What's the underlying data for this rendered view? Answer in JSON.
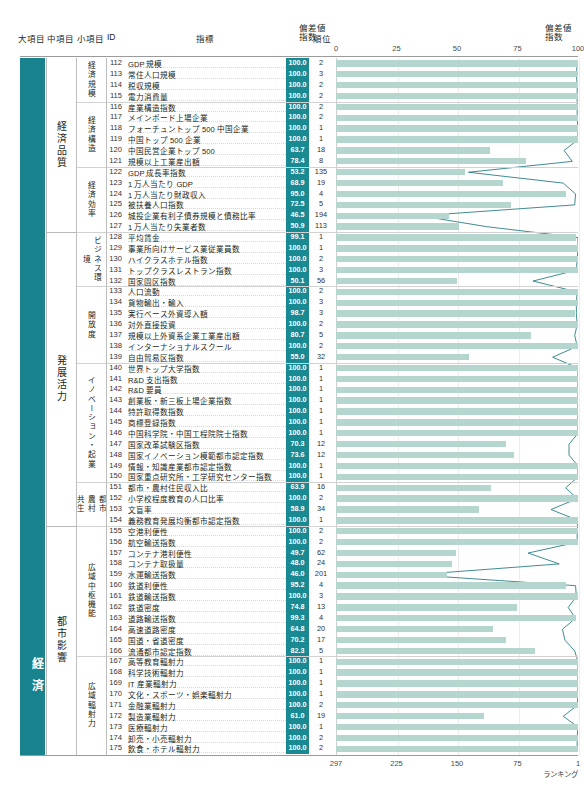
{
  "header": {
    "col_big": "大項目",
    "col_mid": "中項目",
    "col_small": "小項目",
    "col_id": "ID",
    "col_indicator": "指標",
    "col_dev": "偏差値\n指数",
    "col_dev_line1": "偏差値",
    "col_dev_line2": "指数",
    "col_rank": "順位",
    "col_dev_right_line1": "偏差値",
    "col_dev_right_line2": "指数"
  },
  "axis_top": {
    "ticks": [
      "0",
      "25",
      "50",
      "75",
      "100"
    ]
  },
  "axis_bottom": {
    "ticks": [
      "297",
      "225",
      "150",
      "75",
      "1"
    ],
    "label": "ランキング"
  },
  "colors": {
    "teal_dark": "#18838d",
    "badge": "#198a92",
    "bar": "#b4d6ce",
    "line": "#2a7f86",
    "grid": "#ececec"
  },
  "big_category": "経済",
  "mid_categories": [
    {
      "label": "経済品質",
      "start": 112,
      "end": 127
    },
    {
      "label": "発展活力",
      "start": 128,
      "end": 154
    },
    {
      "label": "都市影響",
      "start": 155,
      "end": 175
    }
  ],
  "small_categories": [
    {
      "label": "経済規模",
      "start": 112,
      "end": 115,
      "two_col": false
    },
    {
      "label": "経済構造",
      "start": 116,
      "end": 121,
      "two_col": false
    },
    {
      "label": "経済効率",
      "start": 122,
      "end": 127,
      "two_col": false
    },
    {
      "label": "ビジネス環境",
      "start": 128,
      "end": 132,
      "two_col": false
    },
    {
      "label": "開放度",
      "start": 133,
      "end": 139,
      "two_col": false
    },
    {
      "label": "イノベーション・起業",
      "start": 140,
      "end": 150,
      "two_col": false
    },
    {
      "label": "都市農村共生",
      "start": 151,
      "end": 154,
      "two_col": true,
      "col_a": "共生",
      "col_b": "農村",
      "col_c": "都市"
    },
    {
      "label": "広域中枢機能",
      "start": 155,
      "end": 166,
      "two_col": false
    },
    {
      "label": "広域輻射力",
      "start": 167,
      "end": 175,
      "two_col": false
    }
  ],
  "chart_data": {
    "type": "bar",
    "title": "",
    "xlabel": "",
    "ylabel": "",
    "xlim": [
      0,
      100
    ],
    "rank_axis": [
      297,
      1
    ],
    "grid": true,
    "rows": [
      {
        "id": "112",
        "name": "GDP 規模",
        "dev": "100.0",
        "rank": "2"
      },
      {
        "id": "113",
        "name": "常住人口規模",
        "dev": "100.0",
        "rank": "3"
      },
      {
        "id": "114",
        "name": "税収規模",
        "dev": "100.0",
        "rank": "2"
      },
      {
        "id": "115",
        "name": "電力消費量",
        "dev": "100.0",
        "rank": "2"
      },
      {
        "id": "116",
        "name": "産業構造指数",
        "dev": "100.0",
        "rank": "2"
      },
      {
        "id": "117",
        "name": "メインボード上場企業",
        "dev": "100.0",
        "rank": "2"
      },
      {
        "id": "118",
        "name": "フォーチュントップ 500 中国企業",
        "dev": "100.0",
        "rank": "1"
      },
      {
        "id": "119",
        "name": "中国トップ 500 企業",
        "dev": "100.0",
        "rank": "1"
      },
      {
        "id": "120",
        "name": "中国民営企業トップ 500",
        "dev": "63.7",
        "rank": "18"
      },
      {
        "id": "121",
        "name": "規模以上工業産出額",
        "dev": "78.4",
        "rank": "8"
      },
      {
        "id": "122",
        "name": "GDP 成長率指数",
        "dev": "53.2",
        "rank": "135"
      },
      {
        "id": "123",
        "name": "1 万人当たり GDP",
        "dev": "68.9",
        "rank": "19"
      },
      {
        "id": "124",
        "name": "1 万人当たり財政収入",
        "dev": "95.0",
        "rank": "4"
      },
      {
        "id": "125",
        "name": "被扶養人口指数",
        "dev": "72.5",
        "rank": "5"
      },
      {
        "id": "126",
        "name": "城投企業有利子債券規模と債務比率",
        "dev": "46.5",
        "rank": "194"
      },
      {
        "id": "127",
        "name": "1 万人当たり失業者数",
        "dev": "50.9",
        "rank": "113"
      },
      {
        "id": "128",
        "name": "平均賃金",
        "dev": "99.1",
        "rank": "1"
      },
      {
        "id": "129",
        "name": "事業所向けサービス業従業員数",
        "dev": "100.0",
        "rank": "1"
      },
      {
        "id": "130",
        "name": "ハイクラスホテル指数",
        "dev": "100.0",
        "rank": "2"
      },
      {
        "id": "131",
        "name": "トップクラスレストラン指数",
        "dev": "100.0",
        "rank": "3"
      },
      {
        "id": "132",
        "name": "国家園区指数",
        "dev": "50.1",
        "rank": "56"
      },
      {
        "id": "133",
        "name": "人口流動",
        "dev": "100.0",
        "rank": "2"
      },
      {
        "id": "134",
        "name": "貨物輸出・輸入",
        "dev": "100.0",
        "rank": "3"
      },
      {
        "id": "135",
        "name": "実行ベース外資導入額",
        "dev": "98.7",
        "rank": "3"
      },
      {
        "id": "136",
        "name": "対外直接投資",
        "dev": "100.0",
        "rank": "2"
      },
      {
        "id": "137",
        "name": "規模以上外資系企業工業産出額",
        "dev": "80.7",
        "rank": "5"
      },
      {
        "id": "138",
        "name": "インターナショナルスクール",
        "dev": "100.0",
        "rank": "2"
      },
      {
        "id": "139",
        "name": "自由貿易区指数",
        "dev": "55.0",
        "rank": "32"
      },
      {
        "id": "140",
        "name": "世界トップ大学指数",
        "dev": "100.0",
        "rank": "1"
      },
      {
        "id": "141",
        "name": "R&D 支出指数",
        "dev": "100.0",
        "rank": "1"
      },
      {
        "id": "142",
        "name": "R&D 要員",
        "dev": "100.0",
        "rank": "1"
      },
      {
        "id": "143",
        "name": "創業板・新三板上場企業指数",
        "dev": "100.0",
        "rank": "1"
      },
      {
        "id": "144",
        "name": "特許取得数指数",
        "dev": "100.0",
        "rank": "1"
      },
      {
        "id": "145",
        "name": "商標登録指数",
        "dev": "100.0",
        "rank": "1"
      },
      {
        "id": "146",
        "name": "中国科学院・中国工程院院士指数",
        "dev": "100.0",
        "rank": "1"
      },
      {
        "id": "147",
        "name": "国家改革試験区指数",
        "dev": "70.3",
        "rank": "12"
      },
      {
        "id": "148",
        "name": "国家イノベーション模範都市認定指数",
        "dev": "73.6",
        "rank": "12"
      },
      {
        "id": "149",
        "name": "情報・知識産業都市認定指数",
        "dev": "100.0",
        "rank": "1"
      },
      {
        "id": "150",
        "name": "国家重点研究所・工学研究センター指数",
        "dev": "100.0",
        "rank": "1"
      },
      {
        "id": "151",
        "name": "都市・農村住民収入比",
        "dev": "63.9",
        "rank": "16"
      },
      {
        "id": "152",
        "name": "小学校程度教育の人口比率",
        "dev": "100.0",
        "rank": "2"
      },
      {
        "id": "153",
        "name": "文盲率",
        "dev": "58.9",
        "rank": "34"
      },
      {
        "id": "154",
        "name": "義務教育発展均衡都市認定指数",
        "dev": "100.0",
        "rank": "1"
      },
      {
        "id": "155",
        "name": "空港利便性",
        "dev": "100.0",
        "rank": "2"
      },
      {
        "id": "156",
        "name": "航空輸送指数",
        "dev": "100.0",
        "rank": "2"
      },
      {
        "id": "157",
        "name": "コンテナ港利便性",
        "dev": "49.7",
        "rank": "62"
      },
      {
        "id": "158",
        "name": "コンテナ取扱量",
        "dev": "48.0",
        "rank": "24"
      },
      {
        "id": "159",
        "name": "水運輸送指数",
        "dev": "46.0",
        "rank": "201"
      },
      {
        "id": "160",
        "name": "鉄道利便性",
        "dev": "95.2",
        "rank": "4"
      },
      {
        "id": "161",
        "name": "鉄道輸送指数",
        "dev": "100.0",
        "rank": "3"
      },
      {
        "id": "162",
        "name": "鉄道密度",
        "dev": "74.8",
        "rank": "13"
      },
      {
        "id": "163",
        "name": "道路輸送指数",
        "dev": "99.3",
        "rank": "4"
      },
      {
        "id": "164",
        "name": "高速道路密度",
        "dev": "64.8",
        "rank": "20"
      },
      {
        "id": "165",
        "name": "国道・省道密度",
        "dev": "70.2",
        "rank": "17"
      },
      {
        "id": "166",
        "name": "流通都市認定指数",
        "dev": "82.3",
        "rank": "5"
      },
      {
        "id": "167",
        "name": "高等教育輻射力",
        "dev": "100.0",
        "rank": "1"
      },
      {
        "id": "168",
        "name": "科学技術輻射力",
        "dev": "100.0",
        "rank": "1"
      },
      {
        "id": "169",
        "name": "IT 産業輻射力",
        "dev": "100.0",
        "rank": "1"
      },
      {
        "id": "170",
        "name": "文化・スポーツ・娯楽輻射力",
        "dev": "100.0",
        "rank": "1"
      },
      {
        "id": "171",
        "name": "金融業輻射力",
        "dev": "100.0",
        "rank": "2"
      },
      {
        "id": "172",
        "name": "製造業輻射力",
        "dev": "61.0",
        "rank": "19"
      },
      {
        "id": "173",
        "name": "医療輻射力",
        "dev": "100.0",
        "rank": "1"
      },
      {
        "id": "174",
        "name": "卸売・小売輻射力",
        "dev": "100.0",
        "rank": "2"
      },
      {
        "id": "175",
        "name": "飲食・ホテル輻射力",
        "dev": "100.0",
        "rank": "2"
      }
    ]
  }
}
